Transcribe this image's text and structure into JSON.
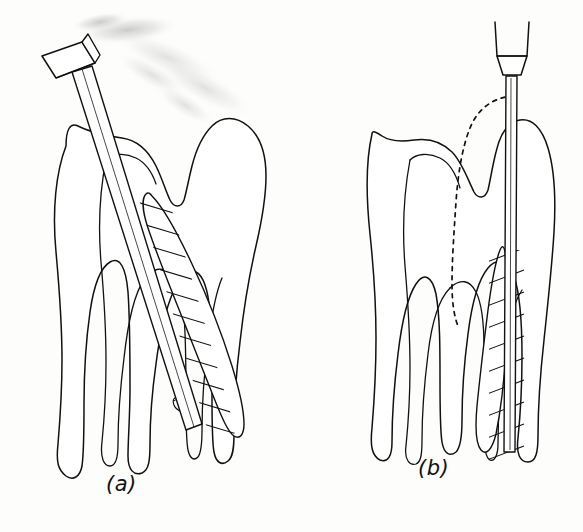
{
  "figure": {
    "type": "line-illustration",
    "background_color": "#fdfdfc",
    "ink_color": "#111111",
    "panel_count": 2,
    "captions": {
      "a": "(a)",
      "b": "(b)"
    },
    "panels": [
      {
        "id": "a",
        "caption": "(a)",
        "caption_position": {
          "x": 106,
          "y": 472
        },
        "description": "Molar tooth in cross-section with a hand instrument inserted obliquely into the distal root canal; a faint pencil smudge trails from the instrument handle toward the upper right.",
        "tooth": {
          "roots": 2,
          "crown_cusps": 2,
          "canal_shading": "diagonal-hatch",
          "canal_shaded": "distal"
        },
        "instrument": {
          "name": "hand-instrument",
          "handle_shape": "cylindrical-tilted",
          "orientation": "oblique",
          "angle_degrees": 28
        },
        "artifacts": {
          "smudge": true,
          "smudge_color": "#d8d8d6"
        }
      },
      {
        "id": "b",
        "caption": "(b)",
        "caption_position": {
          "x": 418,
          "y": 456
        },
        "description": "Same molar with the distal cusp reduced; a rotary handpiece bur is aligned vertically straight down the distal canal. A dashed outline marks the original cusp contour that was removed.",
        "tooth": {
          "roots": 2,
          "crown_cusps": 2,
          "canal_shading": "diagonal-hatch",
          "canal_shaded": "distal"
        },
        "instrument": {
          "name": "rotary-handpiece-bur",
          "handle_shape": "tapered-sleeve",
          "orientation": "vertical",
          "angle_degrees": 0
        },
        "annotations": {
          "dashed_outline": true,
          "dashed_outline_meaning": "original cusp contour removed"
        }
      }
    ]
  }
}
